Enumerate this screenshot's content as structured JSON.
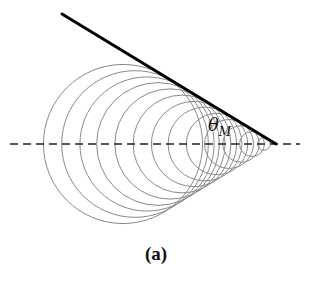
{
  "figure": {
    "caption": "(a)",
    "angle_label": "θ",
    "angle_subscript": "M",
    "apex": {
      "x": 276,
      "y": 144
    },
    "cone_line": {
      "x1": 62,
      "y1": 14,
      "x2": 276,
      "y2": 144
    },
    "axis_y": 144,
    "axis_x_start": 10,
    "axis_x_end": 300,
    "sin_theta": 0.52,
    "circle_distances": [
      153,
      141,
      129,
      118,
      106,
      94,
      82,
      71,
      59,
      47,
      35,
      24,
      12
    ],
    "colors": {
      "circles": "#8a8a8a",
      "cone_line": "#000000",
      "axis": "#222222"
    }
  }
}
